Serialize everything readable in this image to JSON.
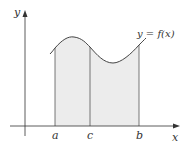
{
  "diagram": {
    "axis_labels": {
      "x": "x",
      "y": "y"
    },
    "curve_label": "y = f(x)",
    "points": {
      "a": "a",
      "c": "c",
      "b": "b"
    },
    "colors": {
      "shade": "#ececec",
      "line": "#555555",
      "axis": "#333333"
    }
  }
}
